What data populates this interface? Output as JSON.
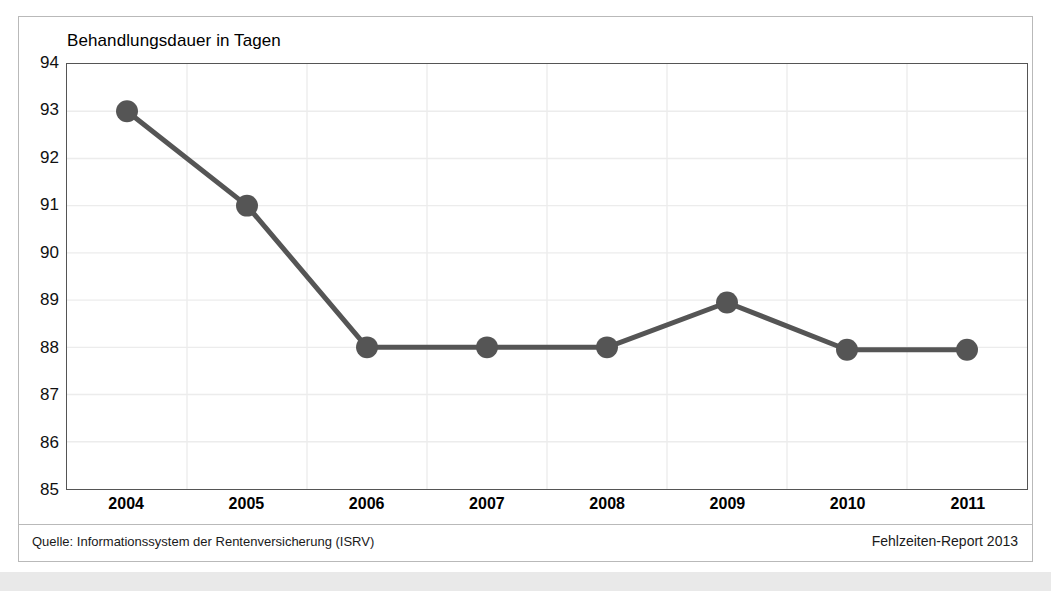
{
  "figure": {
    "title": "Behandlungsdauer in Tagen",
    "source_note": "Quelle: Informationssystem der Rentenversicherung (ISRV)",
    "report_note": "Fehlzeiten-Report 2013"
  },
  "colors": {
    "line": "#555555",
    "marker": "#555555",
    "grid": "#ececec",
    "axis": "#555555",
    "frame": "#b9b9b9",
    "text": "#111111",
    "background": "#ffffff",
    "bottom_strip": "#e9e9e9"
  },
  "chart_data": {
    "type": "line",
    "title": "Behandlungsdauer in Tagen",
    "xlabel": "",
    "ylabel": "",
    "categories": [
      "2004",
      "2005",
      "2006",
      "2007",
      "2008",
      "2009",
      "2010",
      "2011"
    ],
    "x": [
      2004,
      2005,
      2006,
      2007,
      2008,
      2009,
      2010,
      2011
    ],
    "values": [
      93,
      91,
      88,
      88,
      88,
      88.95,
      87.95,
      87.95
    ],
    "series": [
      {
        "name": "Behandlungsdauer in Tagen",
        "values": [
          93,
          91,
          88,
          88,
          88,
          88.95,
          87.95,
          87.95
        ]
      }
    ],
    "ylim": [
      85,
      94
    ],
    "ytick_labels": [
      "94",
      "93",
      "92",
      "91",
      "90",
      "89",
      "88",
      "87",
      "86",
      "85"
    ],
    "yticks": [
      94,
      93,
      92,
      91,
      90,
      89,
      88,
      87,
      86,
      85
    ],
    "grid": true,
    "grid_axis": "both",
    "legend": false,
    "legend_position": "none",
    "marker": "circle",
    "marker_size": 11,
    "line_width": 5
  }
}
